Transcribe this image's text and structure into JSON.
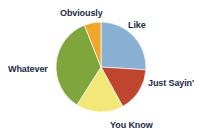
{
  "chart_data": {
    "type": "pie",
    "title": "",
    "subtitle": "",
    "xlabel": "",
    "ylabel": "",
    "legend_position": "none",
    "grid": false,
    "labels_placement": "outside-around-pie",
    "categories": [
      "Like",
      "Just Sayin'",
      "You Know",
      "Whatever",
      "Obviously"
    ],
    "values": [
      26,
      16,
      17,
      35,
      6
    ],
    "unit": "percent",
    "start_angle_deg": 0,
    "direction": "clockwise",
    "slices": [
      {
        "label": "Like",
        "value": 26,
        "color": "#8ab0d4",
        "start_angle_deg": 0,
        "end_angle_deg": 93.6,
        "label_x": 128,
        "label_y": 20
      },
      {
        "label": "Just Sayin'",
        "value": 16,
        "color": "#c0452f",
        "start_angle_deg": 93.6,
        "end_angle_deg": 151.2,
        "label_x": 148,
        "label_y": 78
      },
      {
        "label": "You Know",
        "value": 17,
        "color": "#f2e878",
        "start_angle_deg": 151.2,
        "end_angle_deg": 212.4,
        "label_x": 110,
        "label_y": 120
      },
      {
        "label": "Whatever",
        "value": 35,
        "color": "#7fa63c",
        "start_angle_deg": 212.4,
        "end_angle_deg": 338.4,
        "label_x": 8,
        "label_y": 64
      },
      {
        "label": "Obviously",
        "value": 6,
        "color": "#efa62b",
        "start_angle_deg": 338.4,
        "end_angle_deg": 360,
        "label_x": 60,
        "label_y": 8
      }
    ],
    "geometry": {
      "center_x": 101,
      "center_y": 67,
      "radius": 45
    },
    "background_color": "#ffffff",
    "label_color": "#1b2a44"
  }
}
